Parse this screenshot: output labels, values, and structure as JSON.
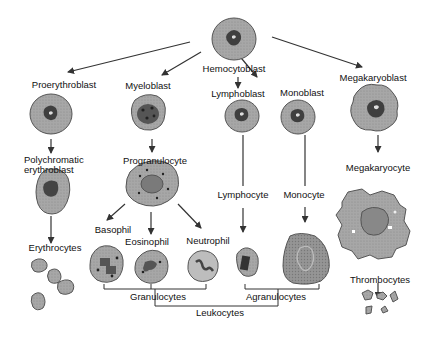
{
  "diagram": {
    "type": "hematopoiesis-lineage-tree",
    "colors": {
      "background": "#ffffff",
      "cell_fill": "#a9a9a9",
      "cell_stroke": "#555555",
      "nucleus_fill": "#3f3f3f",
      "arrow": "#333333",
      "text": "#111111"
    },
    "labels": {
      "hemocytoblast": "Hemocytoblast",
      "proerythroblast": "Proerythroblast",
      "myeloblast": "Myeloblast",
      "lymphoblast": "Lymphoblast",
      "monoblast": "Monoblast",
      "megakaryoblast": "Megakaryoblast",
      "polychromatic_1": "Polychromatic",
      "polychromatic_2": "erythroblast",
      "progranulocyte": "Progranulocyte",
      "lymphocyte": "Lymphocyte",
      "monocyte": "Monocyte",
      "megakaryocyte": "Megakaryocyte",
      "basophil": "Basophil",
      "eosinophil": "Eosinophil",
      "neutrophil": "Neutrophil",
      "erythrocytes": "Erythrocytes",
      "thrombocytes": "Thrombocytes",
      "granulocytes": "Granulocytes",
      "agranulocytes": "Agranulocytes",
      "leukocytes": "Leukocytes"
    },
    "nodes": [
      {
        "id": "hemocytoblast",
        "children": [
          "proerythroblast",
          "myeloblast",
          "lymphoblast",
          "monoblast",
          "megakaryoblast"
        ]
      },
      {
        "id": "proerythroblast",
        "children": [
          "polychromatic_erythroblast"
        ]
      },
      {
        "id": "polychromatic_erythroblast",
        "children": [
          "erythrocytes"
        ]
      },
      {
        "id": "myeloblast",
        "children": [
          "progranulocyte"
        ]
      },
      {
        "id": "progranulocyte",
        "children": [
          "basophil",
          "eosinophil",
          "neutrophil"
        ]
      },
      {
        "id": "lymphoblast",
        "children": [
          "lymphocyte"
        ]
      },
      {
        "id": "monoblast",
        "children": [
          "monocyte"
        ]
      },
      {
        "id": "megakaryoblast",
        "children": [
          "megakaryocyte"
        ]
      },
      {
        "id": "megakaryocyte",
        "children": [
          "thrombocytes"
        ]
      }
    ],
    "groups": [
      {
        "label": "Granulocytes",
        "members": [
          "basophil",
          "eosinophil",
          "neutrophil"
        ]
      },
      {
        "label": "Agranulocytes",
        "members": [
          "lymphocyte",
          "monocyte"
        ]
      },
      {
        "label": "Leukocytes",
        "members": [
          "granulocytes",
          "agranulocytes"
        ]
      }
    ]
  }
}
